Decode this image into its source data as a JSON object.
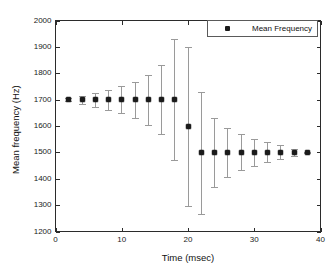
{
  "chart_data": {
    "type": "scatter",
    "title": "",
    "xlabel": "Time (msec)",
    "ylabel": "Mean frequency (Hz)",
    "xlim": [
      0,
      40
    ],
    "ylim": [
      1200,
      2000
    ],
    "xticks": [
      0,
      10,
      20,
      30,
      40
    ],
    "yticks": [
      1200,
      1300,
      1400,
      1500,
      1600,
      1700,
      1800,
      1900,
      2000
    ],
    "xtick_labels": [
      "0",
      "10",
      "20",
      "30",
      "40"
    ],
    "ytick_labels": [
      "1200",
      "1300",
      "1400",
      "1500",
      "1600",
      "1700",
      "1800",
      "1900",
      "2000"
    ],
    "grid": false,
    "legend": {
      "position": "top-right",
      "entries": [
        {
          "label": "Mean Frequency",
          "marker": "asterisk",
          "color": "#1b1b1b"
        }
      ]
    },
    "series": [
      {
        "name": "Mean Frequency",
        "marker": "asterisk",
        "color": "#1b1b1b",
        "errorbar_color": "#9a9a9a",
        "x": [
          2,
          4,
          6,
          8,
          10,
          12,
          14,
          16,
          18,
          20,
          22,
          24,
          26,
          28,
          30,
          32,
          34,
          36,
          38
        ],
        "y": [
          1700,
          1700,
          1700,
          1700,
          1700,
          1700,
          1700,
          1700,
          1700,
          1600,
          1500,
          1500,
          1500,
          1500,
          1500,
          1500,
          1500,
          1500,
          1500
        ],
        "y_lower": [
          1694,
          1684,
          1672,
          1662,
          1650,
          1630,
          1605,
          1568,
          1470,
          1298,
          1268,
          1367,
          1407,
          1432,
          1448,
          1462,
          1473,
          1487,
          1498
        ],
        "y_upper": [
          1706,
          1714,
          1727,
          1738,
          1750,
          1768,
          1793,
          1833,
          1930,
          1900,
          1730,
          1630,
          1592,
          1568,
          1552,
          1538,
          1527,
          1513,
          1502
        ]
      }
    ]
  }
}
